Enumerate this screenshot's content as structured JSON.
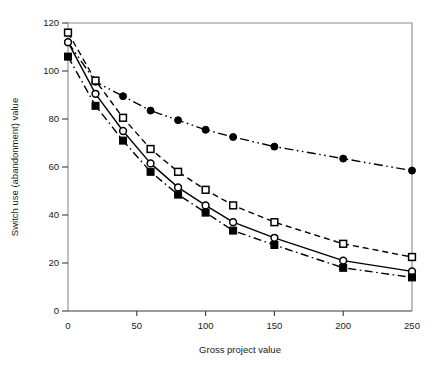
{
  "chart_data": {
    "type": "line",
    "title": "",
    "xlabel": "Gross project value",
    "ylabel": "Switch use (abandonment) value",
    "x": [
      0,
      20,
      40,
      60,
      80,
      100,
      120,
      150,
      200,
      250
    ],
    "xlim": [
      0,
      250
    ],
    "ylim": [
      0,
      120
    ],
    "xticks": [
      0,
      50,
      100,
      150,
      200,
      250
    ],
    "yticks": [
      0,
      20,
      40,
      60,
      80,
      100,
      120
    ],
    "xtick_labels": [
      "0",
      "50",
      "100",
      "150",
      "200",
      "250"
    ],
    "ytick_labels": [
      "0",
      "20",
      "40",
      "60",
      "80",
      "100",
      "120"
    ],
    "grid": false,
    "legend": "none",
    "series": [
      {
        "name": "series-filled-circle",
        "marker": "filled-circle",
        "linestyle": "dash-dot-dot",
        "color": "#000000",
        "values": [
          112,
          95.5,
          89.5,
          83.5,
          79.5,
          75.5,
          72.5,
          68.5,
          63.5,
          58.5
        ]
      },
      {
        "name": "series-open-square",
        "marker": "open-square",
        "linestyle": "dashed",
        "color": "#000000",
        "values": [
          116,
          96,
          80.5,
          67.5,
          58,
          50.5,
          44,
          37,
          28,
          22.5
        ]
      },
      {
        "name": "series-open-circle",
        "marker": "open-circle",
        "linestyle": "solid",
        "color": "#000000",
        "values": [
          112,
          90.5,
          75,
          61.5,
          51.5,
          44,
          37,
          30.5,
          21,
          16.5
        ]
      },
      {
        "name": "series-filled-square",
        "marker": "filled-square",
        "linestyle": "dash-dot",
        "color": "#000000",
        "values": [
          106,
          85.5,
          71,
          58,
          48.5,
          41,
          33.5,
          27.5,
          18,
          14
        ]
      }
    ]
  }
}
